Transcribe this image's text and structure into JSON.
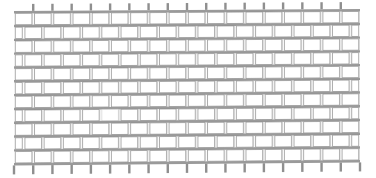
{
  "figure": {
    "background_color": "#ffffff",
    "canvas": {
      "width": 376,
      "height": 178
    }
  },
  "style": {
    "brick_fill": "#ffffff",
    "brick_outline": "#8a8a8a",
    "mortar_color": "#9a9a9a",
    "mortar_shadow": "#bdbdbd",
    "highlight_fill": "#ffffff",
    "highlight_outline": "#d8d8d8",
    "stroke_width": 0.7
  },
  "wall": {
    "bond_pattern": "running-bond",
    "course_count": 11,
    "bricks_per_course": 18,
    "offset_ratio": 0.5,
    "bounds": {
      "left": 14,
      "right": 360,
      "top": 11,
      "bottom": 163
    },
    "course_height": 13.8,
    "bed_joint_thickness": 2.4,
    "head_joint_thickness": 2.6,
    "brick_width": 19.2,
    "skew": {
      "left_edge_top": 11,
      "left_edge_bottom": 163,
      "right_edge_top": 9,
      "right_edge_bottom": 160,
      "note": "rows rise very slightly toward the right"
    },
    "top_stubs": {
      "count": 18,
      "height": 7,
      "width": 2.4,
      "label": "head-joint stub above top course"
    },
    "bottom_stubs": {
      "count": 18,
      "height": 9,
      "width": 2.4,
      "label": "head-joint stub below bottom course"
    },
    "highlight_brick": {
      "course_index": 7,
      "brick_index": 4,
      "label": "lightly rendered brick"
    }
  },
  "chart_data": {
    "type": "diagram",
    "courses": 11,
    "bricks_per_course": 18
  }
}
